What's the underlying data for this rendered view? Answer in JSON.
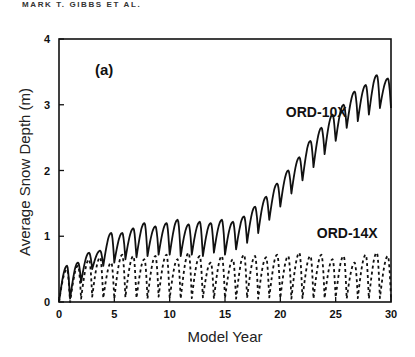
{
  "header": {
    "running_head": "MARK T. GIBBS ET AL."
  },
  "chart_data": {
    "type": "line",
    "title": "",
    "panel_label": "(a)",
    "xlabel": "Model Year",
    "ylabel": "Average Snow Depth (m)",
    "xlim": [
      0,
      30
    ],
    "ylim": [
      0,
      4
    ],
    "xticks": [
      0,
      5,
      10,
      15,
      20,
      25,
      30
    ],
    "yticks": [
      0,
      1,
      2,
      3,
      4
    ],
    "grid": false,
    "legend": "inline labels",
    "series": [
      {
        "name": "ORD-10X",
        "style": "solid",
        "label_pos": {
          "x": 20.5,
          "y": 2.82
        },
        "annual_peaks": [
          0.55,
          0.6,
          0.75,
          0.78,
          1.05,
          1.05,
          1.12,
          1.2,
          1.15,
          1.2,
          1.25,
          1.18,
          1.22,
          1.2,
          1.25,
          1.22,
          1.3,
          1.45,
          1.6,
          1.8,
          2.0,
          2.2,
          2.45,
          2.65,
          2.85,
          3.0,
          3.2,
          3.3,
          3.45,
          3.4
        ],
        "annual_troughs": [
          0.0,
          0.05,
          0.3,
          0.5,
          0.55,
          0.6,
          0.65,
          0.68,
          0.7,
          0.72,
          0.72,
          0.7,
          0.72,
          0.7,
          0.75,
          0.72,
          0.8,
          0.9,
          1.05,
          1.25,
          1.45,
          1.65,
          1.85,
          2.05,
          2.25,
          2.45,
          2.65,
          2.75,
          2.85,
          2.95
        ]
      },
      {
        "name": "ORD-14X",
        "style": "dashed",
        "label_pos": {
          "x": 23.3,
          "y": 0.98
        },
        "annual_peaks": [
          0.5,
          0.55,
          0.65,
          0.68,
          0.6,
          0.72,
          0.7,
          0.65,
          0.7,
          0.72,
          0.65,
          0.75,
          0.7,
          0.6,
          0.7,
          0.65,
          0.72,
          0.7,
          0.68,
          0.72,
          0.7,
          0.75,
          0.7,
          0.72,
          0.65,
          0.7,
          0.6,
          0.72,
          0.75,
          0.7
        ],
        "annual_troughs": [
          0.0,
          0.0,
          0.05,
          0.08,
          0.06,
          0.05,
          0.07,
          0.06,
          0.05,
          0.08,
          0.06,
          0.05,
          0.06,
          0.07,
          0.05,
          0.06,
          0.05,
          0.06,
          0.05,
          0.07,
          0.06,
          0.05,
          0.06,
          0.05,
          0.06,
          0.07,
          0.05,
          0.06,
          0.05,
          0.06
        ]
      }
    ]
  }
}
